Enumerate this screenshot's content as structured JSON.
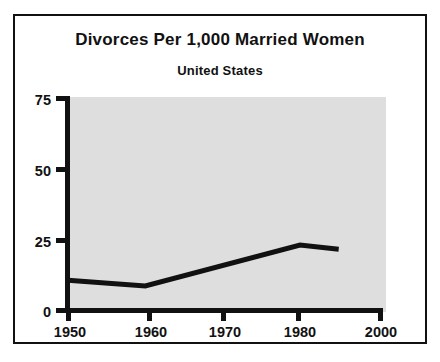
{
  "chart_data": {
    "type": "line",
    "title": "Divorces Per 1,000 Married Women",
    "subtitle": "United States",
    "xlabel": "",
    "ylabel": "",
    "xlim": [
      1950,
      2000
    ],
    "ylim": [
      0,
      75
    ],
    "grid": false,
    "legend": null,
    "plot_background_color": "#dedede",
    "line_color": "#111111",
    "frame_color": "#111111",
    "x_ticks": [
      "1950",
      "1960",
      "1970",
      "1980",
      "2000"
    ],
    "y_ticks": [
      "0",
      "25",
      "50",
      "75"
    ],
    "series": [
      {
        "name": "Divorces per 1,000 married women",
        "x": [
          1950,
          1960,
          1980,
          1985
        ],
        "values": [
          10.5,
          8.5,
          23,
          21.5
        ]
      }
    ],
    "points": [
      {
        "year": "1950",
        "value": 10.5
      },
      {
        "year": "1960",
        "value": 8.5
      },
      {
        "year": "1980",
        "value": 23
      },
      {
        "year": "1985",
        "value": 21.5
      }
    ]
  }
}
